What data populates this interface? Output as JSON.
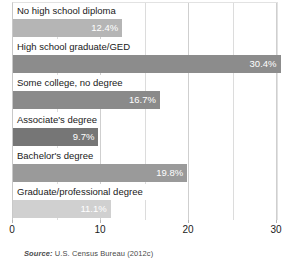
{
  "chart_data": {
    "type": "bar",
    "orientation": "horizontal",
    "title": "",
    "xlabel": "",
    "ylabel": "",
    "xlim": [
      0,
      30
    ],
    "xticks": [
      0,
      10,
      20,
      30
    ],
    "xtick_labels": [
      "0",
      "10",
      "20",
      "30"
    ],
    "minor_gridlines": [
      5,
      15,
      25
    ],
    "grid": true,
    "legend": "none",
    "categories": [
      "No high school diploma",
      "High school graduate/GED",
      "Some college, no degree",
      "Associate's degree",
      "Bachelor's degree",
      "Graduate/professional degree"
    ],
    "values": [
      12.4,
      30.4,
      16.7,
      9.7,
      19.8,
      11.1
    ],
    "value_labels": [
      "12.4%",
      "30.4%",
      "16.7%",
      "9.7%",
      "19.8%",
      "11.1%"
    ],
    "bar_colors": [
      "#b5b5b5",
      "#8c8c8c",
      "#8a8a8a",
      "#767676",
      "#9a9a9a",
      "#d0d0d0"
    ],
    "value_label_color": "#ffffff",
    "gridline_color": "#dcdcdc",
    "axis_color": "#c8c8c8"
  },
  "source": {
    "prefix": "Source:",
    "text": " U.S. Census Bureau (2012c)"
  }
}
